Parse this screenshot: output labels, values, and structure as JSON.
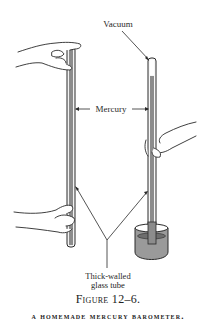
{
  "figure": {
    "labels": {
      "vacuum": "Vacuum",
      "mercury": "Mercury",
      "tube_line1": "Thick-walled",
      "tube_line2": "glass tube"
    },
    "number": "Figure 12–6.",
    "title": "A HOMEMADE MERCURY BAROMETER."
  },
  "colors": {
    "ink": "#2a2a2a",
    "mercury": "#8c8c8c",
    "glass": "#d9d9d9",
    "beaker_fill": "#9a9a9a"
  }
}
